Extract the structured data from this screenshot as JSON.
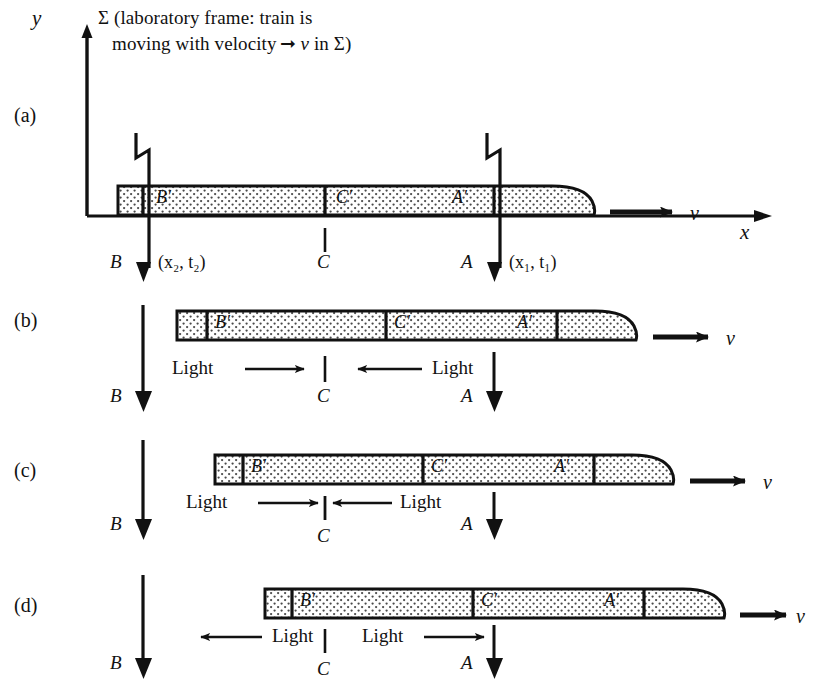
{
  "figure": {
    "title_line1": "Σ (laboratory frame:  train is",
    "title_line2_a": "moving with velocity",
    "title_line2_b": "v",
    "title_line2_c": "in Σ)",
    "axis": {
      "y_label": "y",
      "x_label": "x"
    },
    "velocity_symbol": "v"
  },
  "panels": [
    {
      "id": "a",
      "label": "(a)",
      "train_marks": [
        "B′",
        "C′",
        "A′"
      ],
      "ground_marks": [
        "B",
        "C",
        "A"
      ],
      "coords": {
        "B": "(x₂, t₂)",
        "A": "(x₁, t₁)"
      },
      "lightning": [
        "B",
        "A"
      ],
      "velocity_symbol": "v",
      "light_labels": []
    },
    {
      "id": "b",
      "label": "(b)",
      "train_marks": [
        "B′",
        "C′",
        "A′"
      ],
      "ground_marks": [
        "B",
        "C",
        "A"
      ],
      "light_labels": [
        {
          "text": "Light",
          "direction": "right"
        },
        {
          "text": "Light",
          "direction": "left"
        }
      ],
      "velocity_symbol": "v"
    },
    {
      "id": "c",
      "label": "(c)",
      "train_marks": [
        "B′",
        "C′",
        "A′"
      ],
      "ground_marks": [
        "B",
        "C",
        "A"
      ],
      "light_labels": [
        {
          "text": "Light",
          "direction": "right"
        },
        {
          "text": "Light",
          "direction": "left"
        }
      ],
      "velocity_symbol": "v"
    },
    {
      "id": "d",
      "label": "(d)",
      "train_marks": [
        "B′",
        "C′",
        "A′"
      ],
      "ground_marks": [
        "B",
        "C",
        "A"
      ],
      "light_labels": [
        {
          "text": "Light",
          "direction": "left"
        },
        {
          "text": "Light",
          "direction": "right"
        }
      ],
      "velocity_symbol": "v"
    }
  ],
  "colors": {
    "ink": "#111111",
    "paper": "#ffffff",
    "stipple": "#555555"
  }
}
